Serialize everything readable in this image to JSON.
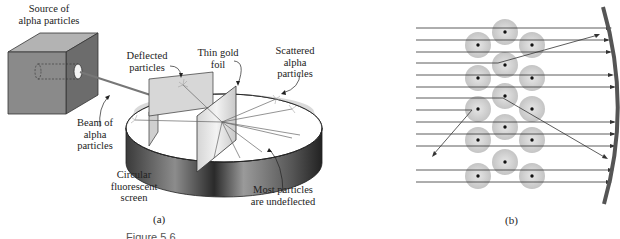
{
  "panel_a": {
    "labels": {
      "source": [
        "Source of",
        "alpha particles"
      ],
      "deflected": [
        "Deflected",
        "particles"
      ],
      "foil": [
        "Thin gold",
        "foil"
      ],
      "scattered": [
        "Scattered",
        "alpha",
        "particles"
      ],
      "beam": [
        "Beam of",
        "alpha",
        "particles"
      ],
      "screen": [
        "Circular",
        "fluorescent",
        "screen"
      ],
      "undeflected": [
        "Most particles",
        "are undeflected"
      ]
    },
    "caption": "(a)"
  },
  "panel_b": {
    "caption": "(b)",
    "nucleus_count": 14
  },
  "figure_label": "Figure 5.6",
  "colors": {
    "box_front": "#8a8a8a",
    "box_top": "#b5b5b5",
    "box_side": "#6e6e6e",
    "screen_inner": "#d8d8d8",
    "screen_band": "#5a5a5a",
    "atom": "#d0d0d0",
    "line": "#333333"
  }
}
